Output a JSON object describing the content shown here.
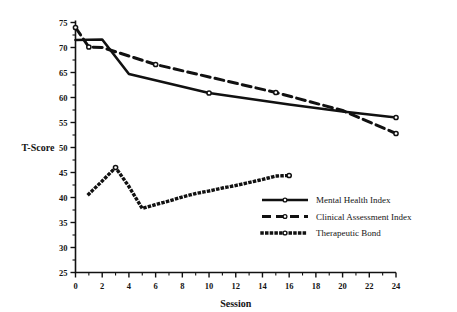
{
  "chart_data": {
    "type": "line",
    "title": "",
    "xlabel": "Session",
    "ylabel": "T-Score",
    "xlim": [
      0,
      24
    ],
    "ylim": [
      25,
      75
    ],
    "xticks": [
      0,
      2,
      4,
      6,
      8,
      10,
      12,
      14,
      16,
      18,
      20,
      22,
      24
    ],
    "yticks": [
      25,
      30,
      35,
      40,
      45,
      50,
      55,
      60,
      65,
      70,
      75
    ],
    "xtick_labels": [
      "0",
      "2",
      "4",
      "6",
      "8",
      "10",
      "12",
      "14",
      "16",
      "18",
      "20",
      "22",
      "24"
    ],
    "ytick_labels": [
      "25",
      "30",
      "35",
      "40",
      "45",
      "50",
      "55",
      "60",
      "65",
      "70",
      "75"
    ],
    "minor_ticks": true,
    "grid": false,
    "legend_position": "lower right",
    "series": [
      {
        "name": "Mental Health Index",
        "style": "solid",
        "x": [
          0,
          2,
          4,
          10,
          16,
          20,
          24
        ],
        "y": [
          71.5,
          71.6,
          64.7,
          60.9,
          58.6,
          57.2,
          56.0
        ],
        "markers_at": [
          {
            "x": 10,
            "y": 60.9
          },
          {
            "x": 24,
            "y": 56.0
          }
        ]
      },
      {
        "name": "Clinical Assessment Index",
        "style": "dashed",
        "x": [
          0,
          1,
          2,
          6,
          15,
          20,
          24
        ],
        "y": [
          74.0,
          70.1,
          70.0,
          66.6,
          61.0,
          57.4,
          52.8
        ],
        "markers_at": [
          {
            "x": 0,
            "y": 74.0
          },
          {
            "x": 1,
            "y": 70.1
          },
          {
            "x": 6,
            "y": 66.6
          },
          {
            "x": 15,
            "y": 61.0
          },
          {
            "x": 24,
            "y": 52.8
          }
        ]
      },
      {
        "name": "Therapeutic Bond",
        "style": "dotted",
        "x": [
          1,
          2,
          3,
          4,
          5,
          6,
          7,
          8,
          9,
          10,
          11,
          12,
          13,
          14,
          15,
          16
        ],
        "y": [
          40.7,
          43.3,
          46.0,
          42.2,
          37.8,
          38.6,
          39.3,
          40.1,
          40.8,
          41.3,
          41.9,
          42.4,
          43.0,
          43.6,
          44.3,
          44.4
        ],
        "markers_at": [
          {
            "x": 3,
            "y": 46.0
          },
          {
            "x": 16,
            "y": 44.4
          }
        ]
      }
    ]
  },
  "legend": {
    "items": [
      {
        "label": "Mental Health Index",
        "style": "solid"
      },
      {
        "label": "Clinical Assessment Index",
        "style": "dashed"
      },
      {
        "label": "Therapeutic Bond",
        "style": "dotted"
      }
    ]
  },
  "colors": {
    "ink": "#111111",
    "background": "#ffffff"
  }
}
